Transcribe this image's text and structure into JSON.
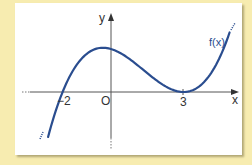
{
  "chart_data": {
    "type": "line",
    "title": "",
    "xlabel": "x",
    "ylabel": "y",
    "origin_label": "O",
    "x_tick_labels": [
      "-2",
      "3"
    ],
    "x_ticks": [
      -2,
      3
    ],
    "series": [
      {
        "name": "f(x)",
        "function": "k(x+2)(x-3)^2",
        "roots": [
          -2,
          3
        ],
        "double_root": 3,
        "local_max": {
          "x": 0,
          "y": "f(0) > 0"
        },
        "local_min": {
          "x": 3,
          "y": 0
        },
        "x_range": [
          -2.6,
          4.9
        ],
        "color": "#2a4d8f"
      }
    ],
    "grid": false,
    "legend": "none (curve labelled inline)"
  },
  "labels": {
    "y_axis": "y",
    "x_axis": "x",
    "origin": "O",
    "tick_neg2": "−2",
    "tick_3": "3",
    "curve": "f(x)"
  },
  "colors": {
    "background": "#f7ecb0",
    "panel": "#ffffff",
    "curve": "#2a4d8f",
    "axes": "#555555"
  }
}
